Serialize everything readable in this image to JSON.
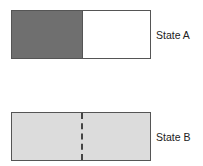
{
  "diagram": {
    "state_a": {
      "label": "State A",
      "left_fill": "#6f6f6f",
      "right_fill": "#ffffff"
    },
    "state_b": {
      "label": "State B",
      "fill": "#dcdcdc",
      "divider": "dashed"
    }
  }
}
